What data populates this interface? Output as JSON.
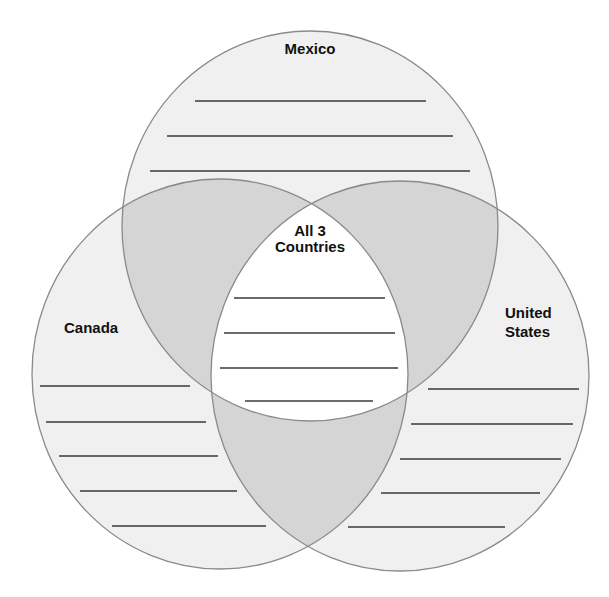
{
  "diagram": {
    "type": "venn",
    "colors": {
      "single_region_fill": "#f0f0f0",
      "pair_overlap_fill": "#d5d5d5",
      "center_fill": "#ffffff",
      "circle_stroke": "#8a8a8a",
      "line_color": "#3a3a3a"
    },
    "circles": [
      {
        "id": "mexico",
        "label": "Mexico",
        "writing_lines": 3
      },
      {
        "id": "canada",
        "label": "Canada",
        "writing_lines": 5
      },
      {
        "id": "united-states",
        "label_line1": "United",
        "label_line2": "States",
        "writing_lines": 5
      }
    ],
    "center": {
      "label_line1": "All 3",
      "label_line2": "Countries",
      "writing_lines": 4
    }
  }
}
